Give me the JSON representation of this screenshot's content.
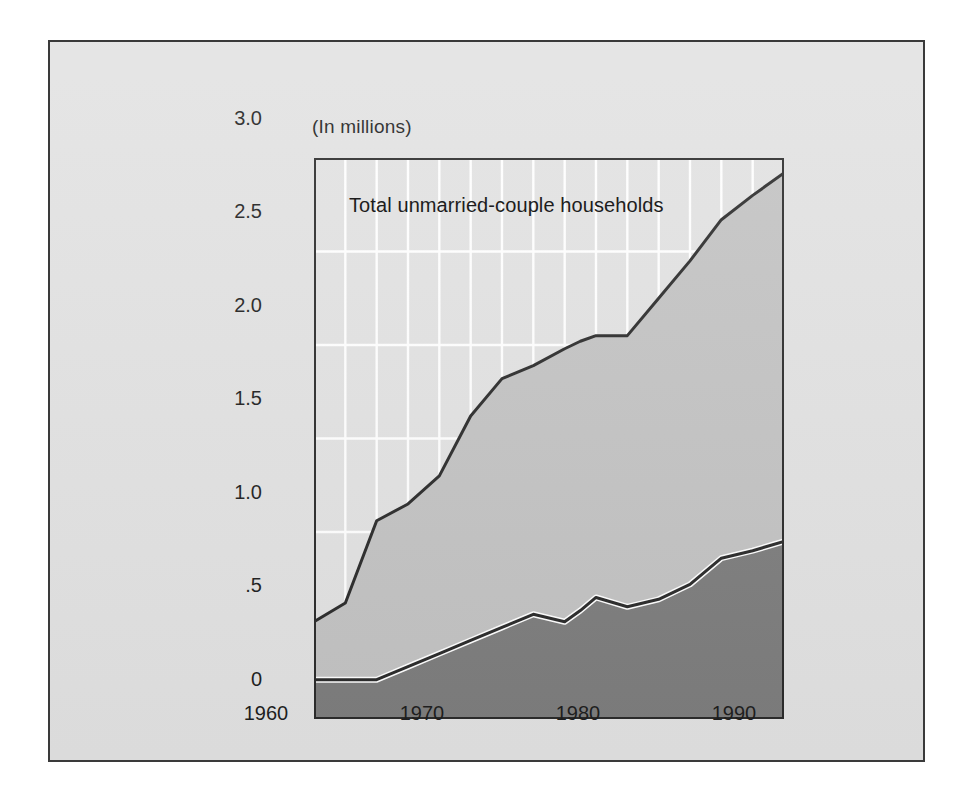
{
  "figure": {
    "unit_label": "(In millions)",
    "series_label": "Total unmarried-couple households"
  },
  "axes": {
    "y_ticks": [
      "3.0",
      "2.5",
      "2.0",
      "1.5",
      "1.0",
      ".5",
      "0"
    ],
    "x_ticks": [
      "1960",
      "1970",
      "1980",
      "1990"
    ]
  },
  "colors": {
    "plate_background": "#e2e2e2",
    "upper_area": "#c3c3c3",
    "lower_area": "#7d7d7d",
    "gridline": "#ffffff",
    "frame": "#2a2a2a",
    "text": "#1d1d1d"
  },
  "chart_data": {
    "type": "area",
    "title": "Total unmarried-couple households",
    "subtitle": "(In millions)",
    "xlabel": "",
    "ylabel": "(In millions)",
    "xlim": [
      1960,
      1990
    ],
    "ylim": [
      0,
      3.0
    ],
    "grid": true,
    "grid_x_step": 2,
    "grid_y_step": 0.5,
    "legend": "inside-top-left",
    "stacked": true,
    "x": [
      1960,
      1962,
      1964,
      1966,
      1968,
      1970,
      1972,
      1974,
      1976,
      1977,
      1978,
      1980,
      1982,
      1984,
      1986,
      1988,
      1990
    ],
    "series": [
      {
        "name": "Lower series (unmarried-couple households, subset)",
        "color": "#7d7d7d",
        "values": [
          0.21,
          0.21,
          0.21,
          0.28,
          0.35,
          0.42,
          0.49,
          0.56,
          0.52,
          0.58,
          0.65,
          0.6,
          0.64,
          0.72,
          0.86,
          0.9,
          0.95
        ]
      },
      {
        "name": "Total unmarried-couple households",
        "color": "#c3c3c3",
        "values": [
          0.52,
          0.62,
          1.06,
          1.15,
          1.3,
          1.62,
          1.82,
          1.89,
          1.98,
          2.02,
          2.05,
          2.05,
          2.25,
          2.45,
          2.67,
          2.8,
          2.92
        ]
      }
    ]
  }
}
